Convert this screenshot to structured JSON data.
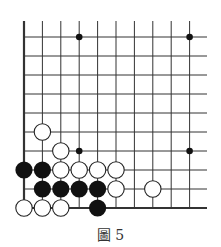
{
  "diagram": {
    "caption": "圖 5",
    "grid": {
      "columns_x": [
        24,
        42.4,
        60.8,
        79.2,
        97.6,
        116,
        134.4,
        152.8,
        171.2,
        189.6
      ],
      "rows_y": [
        37,
        56,
        75,
        94,
        113,
        132,
        151,
        170,
        189,
        208
      ],
      "right_extent": 207,
      "top_extent": 21,
      "left_edge_thick": true,
      "bottom_edge_thick": true,
      "line_color": "#333333"
    },
    "star_points": [
      {
        "col": 3,
        "row": 0
      },
      {
        "col": 9,
        "row": 0
      },
      {
        "col": 3,
        "row": 6
      },
      {
        "col": 9,
        "row": 6
      }
    ],
    "stones": [
      {
        "color": "white",
        "col": 1,
        "row": 5
      },
      {
        "color": "white",
        "col": 2,
        "row": 6
      },
      {
        "color": "black",
        "col": 0,
        "row": 7
      },
      {
        "color": "black",
        "col": 1,
        "row": 7
      },
      {
        "color": "white",
        "col": 2,
        "row": 7
      },
      {
        "color": "white",
        "col": 3,
        "row": 7
      },
      {
        "color": "white",
        "col": 4,
        "row": 7
      },
      {
        "color": "white",
        "col": 5,
        "row": 7
      },
      {
        "color": "black",
        "col": 1,
        "row": 8
      },
      {
        "color": "black",
        "col": 2,
        "row": 8
      },
      {
        "color": "black",
        "col": 3,
        "row": 8
      },
      {
        "color": "black",
        "col": 4,
        "row": 8
      },
      {
        "color": "white",
        "col": 5,
        "row": 8
      },
      {
        "color": "white",
        "col": 7,
        "row": 8
      },
      {
        "color": "white",
        "col": 0,
        "row": 9
      },
      {
        "color": "white",
        "col": 1,
        "row": 9
      },
      {
        "color": "white",
        "col": 2,
        "row": 9
      },
      {
        "color": "black",
        "col": 4,
        "row": 9
      }
    ],
    "colors": {
      "black_stone": "#111111",
      "white_stone_fill": "#ffffff",
      "white_stone_stroke": "#222222"
    }
  }
}
